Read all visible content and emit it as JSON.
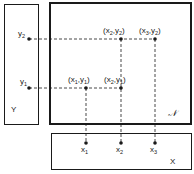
{
  "diagram": {
    "boxes": {
      "y_box": {
        "label": "Y"
      },
      "n_box": {
        "label": "𝒩"
      },
      "x_box": {
        "label": "X"
      }
    },
    "y_points": [
      {
        "name": "y",
        "sub": "2"
      },
      {
        "name": "y",
        "sub": "1"
      }
    ],
    "x_points": [
      {
        "name": "x",
        "sub": "1"
      },
      {
        "name": "x",
        "sub": "2"
      },
      {
        "name": "x",
        "sub": "3"
      }
    ],
    "pairs": [
      {
        "x": "x",
        "xs": "2",
        "y": "y",
        "ys": "2",
        "sep": ","
      },
      {
        "x": "x",
        "xs": "3",
        "y": "y",
        "ys": "2",
        "sep": ","
      },
      {
        "x": "x",
        "xs": "1",
        "y": "y",
        "ys": "1",
        "sep": ","
      },
      {
        "x": "x",
        "xs": "2",
        "y": "y",
        "ys": "1",
        "sep": ","
      }
    ],
    "paren_open": "(",
    "paren_close": ")"
  }
}
